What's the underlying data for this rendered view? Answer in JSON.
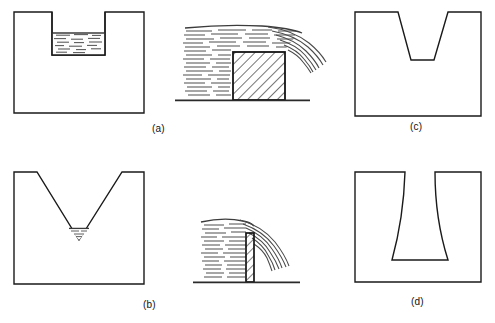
{
  "figure": {
    "background_color": "#ffffff",
    "line_color": "#1a1a1a",
    "hatch_color": "#2a2a2a",
    "water_color": "#4a4a4a"
  },
  "captions": {
    "a": "(a)",
    "b": "(b)",
    "c": "(c)",
    "d": "(d)"
  },
  "panels": [
    {
      "id": "rectangular-notch",
      "position": "top-left",
      "shape": "rectangular notch plate",
      "contains_liquid": true,
      "liquid_fill": "horizontal dashes",
      "outer": {
        "x": 14,
        "y": 12,
        "width": 130,
        "height": 101
      },
      "notch": {
        "x": 52,
        "y": 12,
        "width": 53,
        "height": 43
      },
      "liquid_level_y": 33
    },
    {
      "id": "flow-over-broad-crested-weir",
      "position": "top-middle",
      "shape": "broad crested weir block",
      "hatching": "diagonal",
      "ground_line_y": 100,
      "block": {
        "x": 233,
        "y": 52,
        "width": 52,
        "height": 48
      },
      "water_upstream_left_x": 183,
      "nappe": "curved jet falling right of block"
    },
    {
      "id": "trapezoidal-notch",
      "position": "top-right",
      "shape": "trapezoidal (flared) notch",
      "contains_liquid": false,
      "outer": {
        "x": 355,
        "y": 12,
        "width": 126,
        "height": 104
      },
      "notch_top_left_x": 398,
      "notch_top_right_x": 448,
      "notch_bottom_left_x": 411,
      "notch_bottom_right_x": 434,
      "notch_depth_y": 60
    },
    {
      "id": "vee-notch",
      "position": "bottom-left",
      "shape": "V notch",
      "contains_liquid": true,
      "liquid_fill": "small pool at vertex",
      "outer": {
        "x": 14,
        "y": 172,
        "width": 130,
        "height": 112
      },
      "vee_top_left_x": 37,
      "vee_top_right_x": 122,
      "vee_apex_x": 79,
      "vee_apex_y": 240
    },
    {
      "id": "flow-over-sharp-crested-weir",
      "position": "bottom-middle",
      "shape": "thin sharp crested plate",
      "hatching": "diagonal",
      "ground_line_y": 282,
      "plate": {
        "x": 246,
        "y": 233,
        "width": 8,
        "height": 49
      },
      "water_upstream_left_x": 201,
      "nappe": "curved jet springing clear of plate"
    },
    {
      "id": "curved-sided-notch",
      "position": "bottom-right",
      "shape": "notch with concave curved sides",
      "contains_liquid": false,
      "outer": {
        "x": 355,
        "y": 172,
        "width": 126,
        "height": 110
      },
      "notch_top_left_x": 405,
      "notch_top_right_x": 435,
      "notch_bottom_left_x": 392,
      "notch_bottom_right_x": 448,
      "notch_depth_y": 260
    }
  ]
}
